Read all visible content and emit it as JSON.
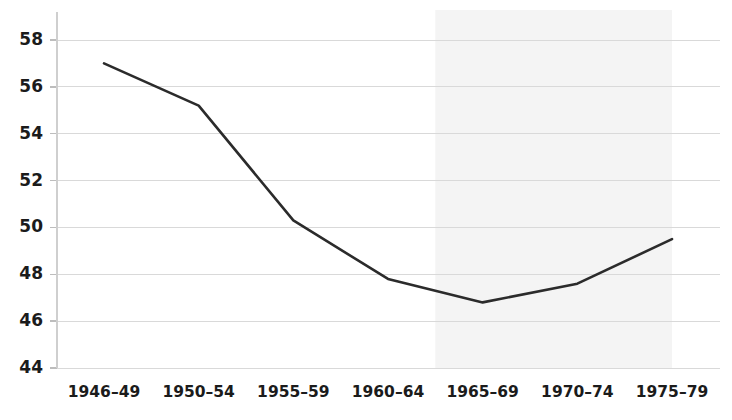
{
  "chart_data": {
    "type": "line",
    "title": "",
    "subtitle": "",
    "xlabel": "",
    "ylabel": "",
    "categories": [
      "1946–49",
      "1950–54",
      "1955–59",
      "1960–64",
      "1965–69",
      "1970–74",
      "1975–79"
    ],
    "series": [
      {
        "name": "value",
        "values": [
          57.0,
          55.2,
          50.3,
          47.8,
          46.8,
          47.6,
          49.5
        ],
        "color": "#2b2b2b"
      }
    ],
    "ylim": [
      44,
      58
    ],
    "yticks": [
      44,
      46,
      48,
      50,
      52,
      54,
      56,
      58
    ],
    "ytick_labels": [
      "44",
      "46",
      "48",
      "50",
      "52",
      "54",
      "56",
      "58"
    ],
    "grid": true,
    "grid_color": "#d9d9d9",
    "legend": false,
    "legend_position": "none",
    "annotations": [
      {
        "type": "shaded-band",
        "label": "",
        "x_start_category": "1965–69",
        "x_end_category": "1975–79",
        "color": "#f4f4f4"
      }
    ]
  }
}
